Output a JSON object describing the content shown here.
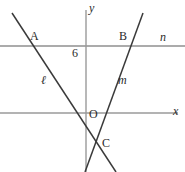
{
  "figure": {
    "kind": "coordinate-geometry-diagram",
    "axes": {
      "x_label": "x",
      "y_label": "y",
      "origin_label": "O",
      "x_axis_y_px": 113,
      "y_axis_x_px": 86
    },
    "tick_labels": {
      "y_intercept_value": "6"
    },
    "line_labels": {
      "line_n": "n",
      "line_m": "m",
      "line_l": "ℓ"
    },
    "points": [
      {
        "name": "A",
        "label": "A"
      },
      {
        "name": "B",
        "label": "B"
      },
      {
        "name": "C",
        "label": "C"
      }
    ],
    "colors": {
      "axis": "#9a9a9a",
      "line_n": "#8f8f8f",
      "line_l": "#3a3a3a",
      "line_m": "#3a3a3a",
      "text": "#2b2b2b",
      "background": "#ffffff"
    },
    "geometry": {
      "line_n": {
        "x1": 0,
        "y1": 46,
        "x2": 185,
        "y2": 46
      },
      "x_axis": {
        "x1": 0,
        "y1": 113,
        "x2": 178,
        "y2": 113
      },
      "y_axis": {
        "x1": 86,
        "y1": 10,
        "x2": 86,
        "y2": 172
      },
      "line_l": {
        "x1": 12,
        "y1": 13,
        "x2": 116,
        "y2": 172
      },
      "line_m": {
        "x1": 143,
        "y1": 13,
        "x2": 85,
        "y2": 172
      }
    }
  }
}
